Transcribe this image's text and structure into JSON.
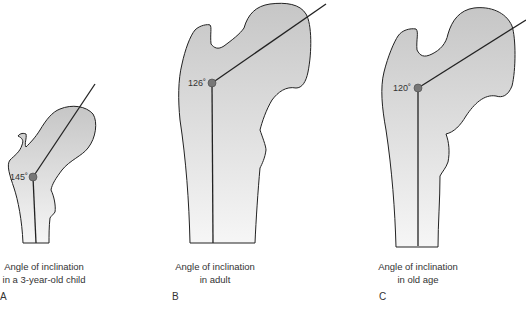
{
  "panels": [
    {
      "letter": "A",
      "angle": "145˚",
      "angle_value": 145,
      "caption_line1": "Angle of inclination",
      "caption_line2": "in a 3-year-old child"
    },
    {
      "letter": "B",
      "angle": "126˚",
      "angle_value": 126,
      "caption_line1": "Angle of inclination",
      "caption_line2": "in adult"
    },
    {
      "letter": "C",
      "angle": "120˚",
      "angle_value": 120,
      "caption_line1": "Angle of inclination",
      "caption_line2": "in old age"
    }
  ],
  "colors": {
    "bone_top": "#c8c8c8",
    "bone_bottom": "#f4f4f4",
    "outline": "#222222",
    "dot": "#777777"
  }
}
